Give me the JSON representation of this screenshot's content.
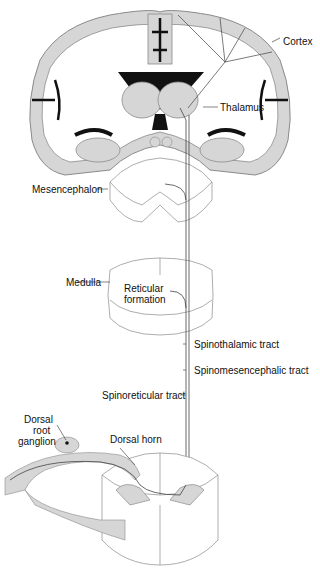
{
  "colors": {
    "tissue": "#d6d6d6",
    "outline": "#8a8a8a",
    "ventricle": "#111111",
    "tract": "#444444",
    "text": "#111111"
  },
  "labels": {
    "cortex": "Cortex",
    "thalamus": "Thalamus",
    "mesencephalon": "Mesencephalon",
    "medulla": "Medulla",
    "reticular_formation_1": "Reticular",
    "reticular_formation_2": "formation",
    "spinothalamic": "Spinothalamic tract",
    "spinomesencephalic": "Spinomesencephalic tract",
    "spinoreticular": "Spinoreticular tract",
    "drg_1": "Dorsal",
    "drg_2": "root",
    "drg_3": "ganglion",
    "dorsal_horn": "Dorsal horn"
  },
  "structures": [
    "brain-coronal-section",
    "mesencephalon-section",
    "medulla-section",
    "spinal-cord-section",
    "dorsal-root-ganglion",
    "ascending-pain-tracts"
  ]
}
